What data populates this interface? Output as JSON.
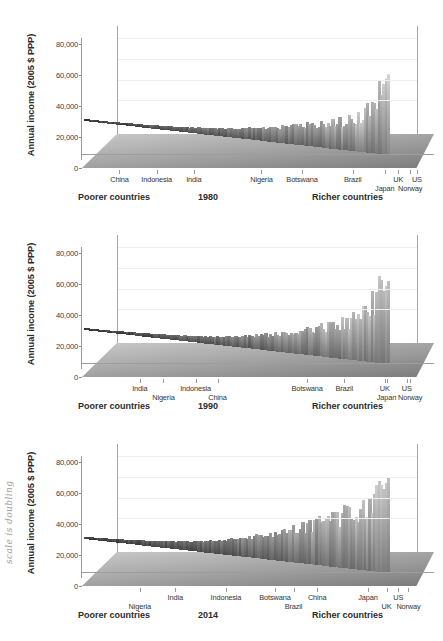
{
  "figure": {
    "y_axis_title": "Annual income (2005 $ PPP)",
    "y_ticks": [
      "0",
      "20,000",
      "40,000",
      "60,000",
      "80,000"
    ],
    "caption_left": "Poorer countries",
    "caption_right": "Richer countries",
    "annotation": "scale is doubling"
  },
  "panels": [
    {
      "year": "1980",
      "labels": [
        {
          "text": "China",
          "x": 0.105,
          "row": 0
        },
        {
          "text": "Indonesia",
          "x": 0.215,
          "row": 0
        },
        {
          "text": "India",
          "x": 0.325,
          "row": 0
        },
        {
          "text": "Nigeria",
          "x": 0.525,
          "row": 0
        },
        {
          "text": "Botswana",
          "x": 0.645,
          "row": 0
        },
        {
          "text": "Brazil",
          "x": 0.795,
          "row": 0
        },
        {
          "text": "Japan",
          "x": 0.89,
          "row": 1
        },
        {
          "text": "UK",
          "x": 0.93,
          "row": 0
        },
        {
          "text": "Norway",
          "x": 0.965,
          "row": 1
        },
        {
          "text": "US",
          "x": 0.985,
          "row": 0
        }
      ]
    },
    {
      "year": "1990",
      "labels": [
        {
          "text": "India",
          "x": 0.165,
          "row": 0
        },
        {
          "text": "Nigeria",
          "x": 0.235,
          "row": 1
        },
        {
          "text": "Indonesia",
          "x": 0.33,
          "row": 0
        },
        {
          "text": "China",
          "x": 0.395,
          "row": 1
        },
        {
          "text": "Botswana",
          "x": 0.66,
          "row": 0
        },
        {
          "text": "Brazil",
          "x": 0.77,
          "row": 0
        },
        {
          "text": "UK",
          "x": 0.89,
          "row": 0
        },
        {
          "text": "Japan",
          "x": 0.895,
          "row": 1
        },
        {
          "text": "US",
          "x": 0.955,
          "row": 0
        },
        {
          "text": "Norway",
          "x": 0.965,
          "row": 1
        }
      ]
    },
    {
      "year": "2014",
      "labels": [
        {
          "text": "Nigeria",
          "x": 0.165,
          "row": 1
        },
        {
          "text": "India",
          "x": 0.27,
          "row": 0
        },
        {
          "text": "Indonesia",
          "x": 0.42,
          "row": 0
        },
        {
          "text": "Botswana",
          "x": 0.565,
          "row": 0
        },
        {
          "text": "Brazil",
          "x": 0.62,
          "row": 1
        },
        {
          "text": "China",
          "x": 0.69,
          "row": 0
        },
        {
          "text": "Japan",
          "x": 0.84,
          "row": 0
        },
        {
          "text": "UK",
          "x": 0.895,
          "row": 1
        },
        {
          "text": "US",
          "x": 0.93,
          "row": 0
        },
        {
          "text": "Norway",
          "x": 0.96,
          "row": 1
        }
      ]
    }
  ],
  "chart_data": {
    "type": "area",
    "xlabel": "Countries ordered from poorer to richer",
    "ylabel": "Annual income (2005 $ PPP)",
    "ylim": [
      0,
      90000
    ],
    "yticks": [
      0,
      20000,
      40000,
      60000,
      80000
    ],
    "grid": true,
    "legend": "none",
    "x_axis_annotations": {
      "left": "Poorer countries",
      "right": "Richer countries"
    },
    "margin_annotation": "scale is doubling",
    "series": [
      {
        "name": "1980",
        "note": "Each country is a ridge running back-to-front; height = income percentile value. Values read off the back ridge envelope.",
        "x": [
          0.0,
          0.05,
          0.1,
          0.15,
          0.2,
          0.25,
          0.3,
          0.35,
          0.4,
          0.45,
          0.5,
          0.55,
          0.6,
          0.65,
          0.7,
          0.75,
          0.8,
          0.85,
          0.9,
          0.95,
          1.0
        ],
        "values": [
          1500,
          1800,
          2200,
          2600,
          3000,
          3600,
          4200,
          5200,
          6400,
          7600,
          9000,
          11000,
          13000,
          15500,
          18000,
          21000,
          24000,
          28000,
          34000,
          45000,
          78000
        ]
      },
      {
        "name": "1990",
        "x": [
          0.0,
          0.05,
          0.1,
          0.15,
          0.2,
          0.25,
          0.3,
          0.35,
          0.4,
          0.45,
          0.5,
          0.55,
          0.6,
          0.65,
          0.7,
          0.75,
          0.8,
          0.85,
          0.9,
          0.95,
          1.0
        ],
        "values": [
          1600,
          2000,
          2400,
          2900,
          3400,
          4000,
          4800,
          5800,
          7000,
          8500,
          10500,
          12500,
          15000,
          18000,
          21500,
          25000,
          29000,
          34000,
          42000,
          56000,
          80000
        ]
      },
      {
        "name": "2014",
        "x": [
          0.0,
          0.05,
          0.1,
          0.15,
          0.2,
          0.25,
          0.3,
          0.35,
          0.4,
          0.45,
          0.5,
          0.55,
          0.6,
          0.65,
          0.7,
          0.75,
          0.8,
          0.85,
          0.9,
          0.95,
          1.0
        ],
        "values": [
          2000,
          2600,
          3200,
          4000,
          5000,
          6200,
          7600,
          9200,
          11000,
          13500,
          16500,
          20000,
          24000,
          28000,
          33000,
          38000,
          44000,
          52000,
          62000,
          74000,
          92000
        ]
      }
    ],
    "highlighted_countries": [
      "China",
      "Indonesia",
      "India",
      "Nigeria",
      "Botswana",
      "Brazil",
      "Japan",
      "UK",
      "US",
      "Norway"
    ]
  }
}
